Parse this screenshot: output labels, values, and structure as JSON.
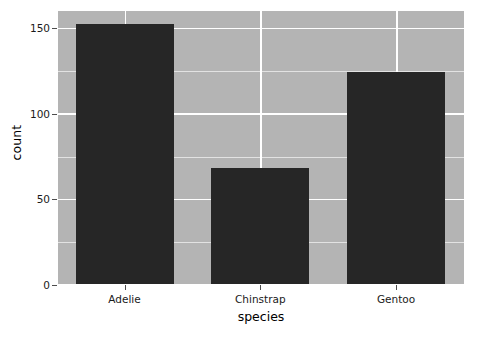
{
  "chart_data": {
    "type": "bar",
    "title": "",
    "subtitle": "",
    "xlabel": "species",
    "ylabel": "count",
    "categories": [
      "Adelie",
      "Chinstrap",
      "Gentoo"
    ],
    "values": [
      152,
      68,
      124
    ],
    "series": [
      {
        "name": "count",
        "values": [
          152,
          68,
          124
        ]
      }
    ],
    "ylim": [
      0,
      160
    ],
    "yticks": [
      0,
      50,
      100,
      150
    ],
    "ytick_labels": [
      "0",
      "50",
      "100",
      "150"
    ],
    "yminor_ticks": [
      25,
      75,
      125
    ],
    "grid": "major-and-minor-horizontal-white",
    "legend": "none",
    "annotations": [],
    "colors": {
      "bar_fill": "#262626",
      "panel_background": "#b4b4b4",
      "grid_major": "#ffffff",
      "grid_minor": "#e2e2e2",
      "figure_background": "#ffffff",
      "text": "#1a1a1a",
      "axis_tick": "#4d4d4d"
    }
  }
}
